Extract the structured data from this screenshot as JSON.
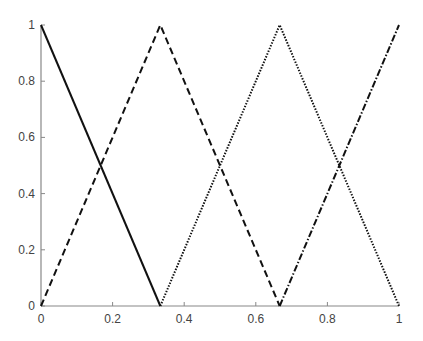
{
  "chart_data": {
    "type": "line",
    "title": "",
    "xlabel": "",
    "ylabel": "",
    "xlim": [
      0,
      1
    ],
    "ylim": [
      0,
      1
    ],
    "grid": false,
    "legend": null,
    "x_ticks": [
      "0",
      "0.2",
      "0.4",
      "0.6",
      "0.8",
      "1"
    ],
    "y_ticks": [
      "0",
      "0.2",
      "0.4",
      "0.6",
      "0.8",
      "1"
    ],
    "series": [
      {
        "name": "mf1",
        "style": "solid",
        "x": [
          0,
          0.3333
        ],
        "y": [
          1,
          0
        ]
      },
      {
        "name": "mf2",
        "style": "dashed",
        "x": [
          0,
          0.3333,
          0.6667
        ],
        "y": [
          0,
          1,
          0
        ]
      },
      {
        "name": "mf3",
        "style": "dotted",
        "x": [
          0.3333,
          0.6667,
          1
        ],
        "y": [
          0,
          1,
          0
        ]
      },
      {
        "name": "mf4",
        "style": "dashdot",
        "x": [
          0.6667,
          1
        ],
        "y": [
          0,
          1
        ]
      }
    ]
  },
  "colors": {
    "line": "#111111",
    "axis": "#888888",
    "label": "#444444"
  }
}
